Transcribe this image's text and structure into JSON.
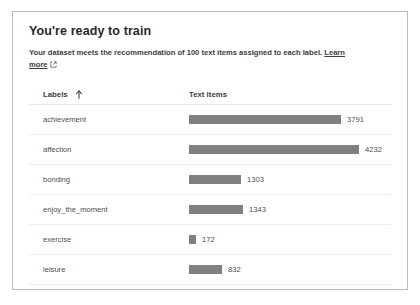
{
  "card": {
    "title": "You're ready to train",
    "subtitle_text": "Your dataset meets the recommendation of 100 text items assigned to each label.",
    "link_learn": "Learn",
    "link_more": "more",
    "external_link_icon": "external-link-icon"
  },
  "table": {
    "columns": {
      "labels": "Labels",
      "text_items": "Text items"
    },
    "sort_icon": "sort-ascending-arrow-icon",
    "sort_column": "Labels",
    "sort_direction": "ascending",
    "rows": [
      {
        "label": "achievement",
        "count": "3791"
      },
      {
        "label": "affection",
        "count": "4232"
      },
      {
        "label": "bonding",
        "count": "1303"
      },
      {
        "label": "enjoy_the_moment",
        "count": "1343"
      },
      {
        "label": "exercise",
        "count": "172"
      },
      {
        "label": "leisure",
        "count": "832"
      },
      {
        "label": "nature",
        "count": "274"
      }
    ]
  },
  "chart_data": {
    "type": "bar",
    "orientation": "horizontal",
    "categories": [
      "achievement",
      "affection",
      "bonding",
      "enjoy_the_moment",
      "exercise",
      "leisure",
      "nature"
    ],
    "values": [
      3791,
      4232,
      1303,
      1343,
      172,
      832,
      274
    ],
    "xlabel": "Text items",
    "ylabel": "Labels",
    "xlim": [
      0,
      4232
    ],
    "grid": false,
    "legend": false,
    "bar_color": "#7e8184",
    "data_labels": true
  },
  "colors": {
    "card_border": "#b9bcbe",
    "bar": "#7e8184",
    "text": "#3c4043",
    "muted_text": "#4a4f54",
    "row_divider": "#eceded",
    "background": "#ffffff"
  }
}
